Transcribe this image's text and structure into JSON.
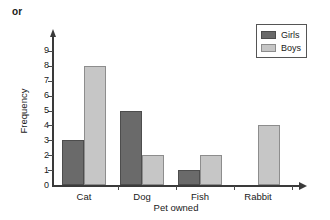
{
  "page": {
    "prefix_note": "or"
  },
  "chart_data": {
    "type": "bar",
    "title": "",
    "xlabel": "Pet owned",
    "ylabel": "Frequency",
    "categories": [
      "Cat",
      "Dog",
      "Fish",
      "Rabbit"
    ],
    "series": [
      {
        "name": "Girls",
        "color": "#6a6a6a",
        "values": [
          3,
          5,
          1,
          0
        ]
      },
      {
        "name": "Boys",
        "color": "#c6c6c6",
        "values": [
          8,
          2,
          2,
          4
        ]
      }
    ],
    "ylim": [
      0,
      9
    ],
    "ytick_labels": [
      "0",
      "1",
      "2",
      "3",
      "4",
      "5",
      "6",
      "7",
      "8",
      "9"
    ],
    "grid": false,
    "legend_position": "top-right",
    "axis_arrows": true
  },
  "legend": {
    "entries": [
      {
        "label": "Girls"
      },
      {
        "label": "Boys"
      }
    ]
  }
}
